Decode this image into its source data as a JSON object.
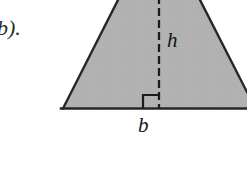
{
  "figure": {
    "part_label": "b).",
    "height_label": "h",
    "base_label": "b",
    "shape_name": "triangle",
    "fill_color": "#b3b3b3",
    "stroke_color": "#262626",
    "background_color": "#ffffff",
    "texture": "halftone-dot-screen",
    "altitude_style": "dashed",
    "right_angle_marker": true,
    "geometry": {
      "base_left_vertex": [
        63,
        108
      ],
      "base_right_edge": [
        247,
        108
      ],
      "left_edge_top": [
        118,
        0
      ],
      "right_edge_top": [
        200,
        0
      ],
      "right_edge_bottom": [
        247,
        95
      ],
      "altitude_x": 159,
      "altitude_foot_y": 108,
      "right_angle_square": [
        143,
        95,
        16,
        13
      ]
    }
  }
}
